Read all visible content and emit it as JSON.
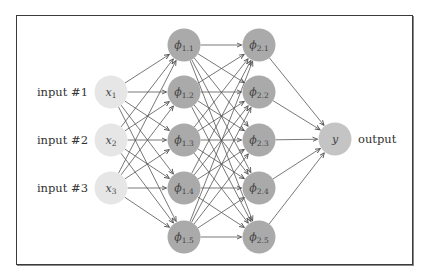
{
  "diagram": {
    "type": "feedforward-neural-network",
    "colors": {
      "input_node": "#e6e6e6",
      "hidden_node": "#aaaaaa",
      "output_node": "#c4c4c4",
      "edge": "#555555",
      "frame": "#3a3a3a"
    },
    "layers": [
      {
        "name": "input",
        "nodes": [
          {
            "id": "x1",
            "symbol": "x",
            "sub": "1",
            "label": "input #1"
          },
          {
            "id": "x2",
            "symbol": "x",
            "sub": "2",
            "label": "input #2"
          },
          {
            "id": "x3",
            "symbol": "x",
            "sub": "3",
            "label": "input #3"
          }
        ]
      },
      {
        "name": "hidden-1",
        "nodes": [
          {
            "id": "p11",
            "symbol": "ϕ",
            "sub": "1.1"
          },
          {
            "id": "p12",
            "symbol": "ϕ",
            "sub": "1.2"
          },
          {
            "id": "p13",
            "symbol": "ϕ",
            "sub": "1.3"
          },
          {
            "id": "p14",
            "symbol": "ϕ",
            "sub": "1.4"
          },
          {
            "id": "p15",
            "symbol": "ϕ",
            "sub": "1.5"
          }
        ]
      },
      {
        "name": "hidden-2",
        "nodes": [
          {
            "id": "p21",
            "symbol": "ϕ",
            "sub": "2.1"
          },
          {
            "id": "p22",
            "symbol": "ϕ",
            "sub": "2.2"
          },
          {
            "id": "p23",
            "symbol": "ϕ",
            "sub": "2.3"
          },
          {
            "id": "p24",
            "symbol": "ϕ",
            "sub": "2.4"
          },
          {
            "id": "p25",
            "symbol": "ϕ",
            "sub": "2.5"
          }
        ]
      },
      {
        "name": "output",
        "nodes": [
          {
            "id": "y",
            "symbol": "y",
            "sub": "",
            "label": "output"
          }
        ]
      }
    ],
    "connectivity": "fully-connected between consecutive layers"
  }
}
